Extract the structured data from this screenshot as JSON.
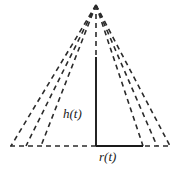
{
  "figure": {
    "background_color": "#ffffff",
    "stroke_color": "#2b2b2b",
    "labels": {
      "height": "h(t)",
      "radius": "r(t)"
    },
    "geometry": {
      "apex": {
        "x": 96,
        "y": 5
      },
      "baseline_y": 146,
      "baseline_dashed_from_x": 10,
      "baseline_dashed_to_x": 171,
      "triangles": [
        {
          "name": "outer-triangle",
          "left_x": 11,
          "right_x": 170
        },
        {
          "name": "middle-triangle",
          "left_x": 26,
          "right_x": 157
        },
        {
          "name": "inner-triangle",
          "left_x": 41,
          "right_x": 143
        }
      ],
      "height_segment": {
        "x": 96,
        "from_y": 57,
        "to_y": 146
      },
      "radius_segment": {
        "y": 146,
        "from_x": 96,
        "to_x": 143
      }
    },
    "style": {
      "dash_pattern": "5 4",
      "dash_width": 1.6,
      "solid_width": 1.8
    }
  }
}
